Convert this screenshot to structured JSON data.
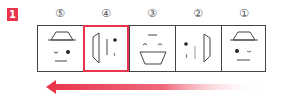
{
  "step_badge": {
    "label": "1",
    "color": "#e8334a"
  },
  "panels": [
    {
      "order_label": "⑤",
      "view": "front-face-left-gaze",
      "highlighted": false
    },
    {
      "order_label": "④",
      "view": "left-profile",
      "highlighted": true
    },
    {
      "order_label": "③",
      "view": "back-open-mouth",
      "highlighted": false
    },
    {
      "order_label": "②",
      "view": "right-profile",
      "highlighted": false
    },
    {
      "order_label": "①",
      "view": "front-face-right-gaze",
      "highlighted": false
    }
  ],
  "arrow": {
    "direction": "left",
    "color": "#e8334a"
  },
  "colors": {
    "outline": "#444444",
    "highlight": "#e8334a"
  }
}
